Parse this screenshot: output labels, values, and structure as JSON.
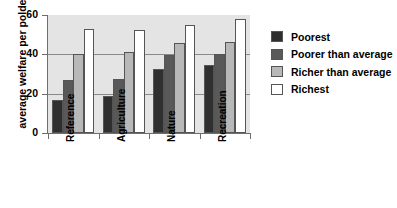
{
  "chart_data": {
    "type": "bar",
    "title": "",
    "xlabel": "",
    "ylabel": "average welfare per polder",
    "categories": [
      "Reference",
      "Agriculture",
      "Nature",
      "Recreation"
    ],
    "series": [
      {
        "name": "Poorest",
        "color": "#2f2f2f",
        "values": [
          17,
          19,
          32.5,
          34.5
        ]
      },
      {
        "name": "Poorer than average",
        "color": "#595959",
        "values": [
          27,
          27.5,
          39.5,
          40
        ]
      },
      {
        "name": "Richer than average",
        "color": "#b8b8b8",
        "values": [
          40,
          41,
          46,
          46.5
        ]
      },
      {
        "name": "Richest",
        "color": "#ffffff",
        "values": [
          53,
          52.5,
          55,
          58
        ]
      }
    ],
    "ylim": [
      0,
      60
    ],
    "yticks": [
      0,
      20,
      40,
      60
    ],
    "ytick_labels": [
      "0",
      "20",
      "40",
      "60"
    ],
    "gridlines": [
      20,
      40
    ],
    "grid": true,
    "legend_position": "right",
    "plot_background": "#e4e4e4",
    "axis_color": "#6e6e6e",
    "bar_edge_color": "#555555"
  },
  "legend": {
    "items": [
      {
        "label": "Poorest"
      },
      {
        "label": "Poorer than average"
      },
      {
        "label": "Richer than average"
      },
      {
        "label": "Richest"
      }
    ]
  }
}
